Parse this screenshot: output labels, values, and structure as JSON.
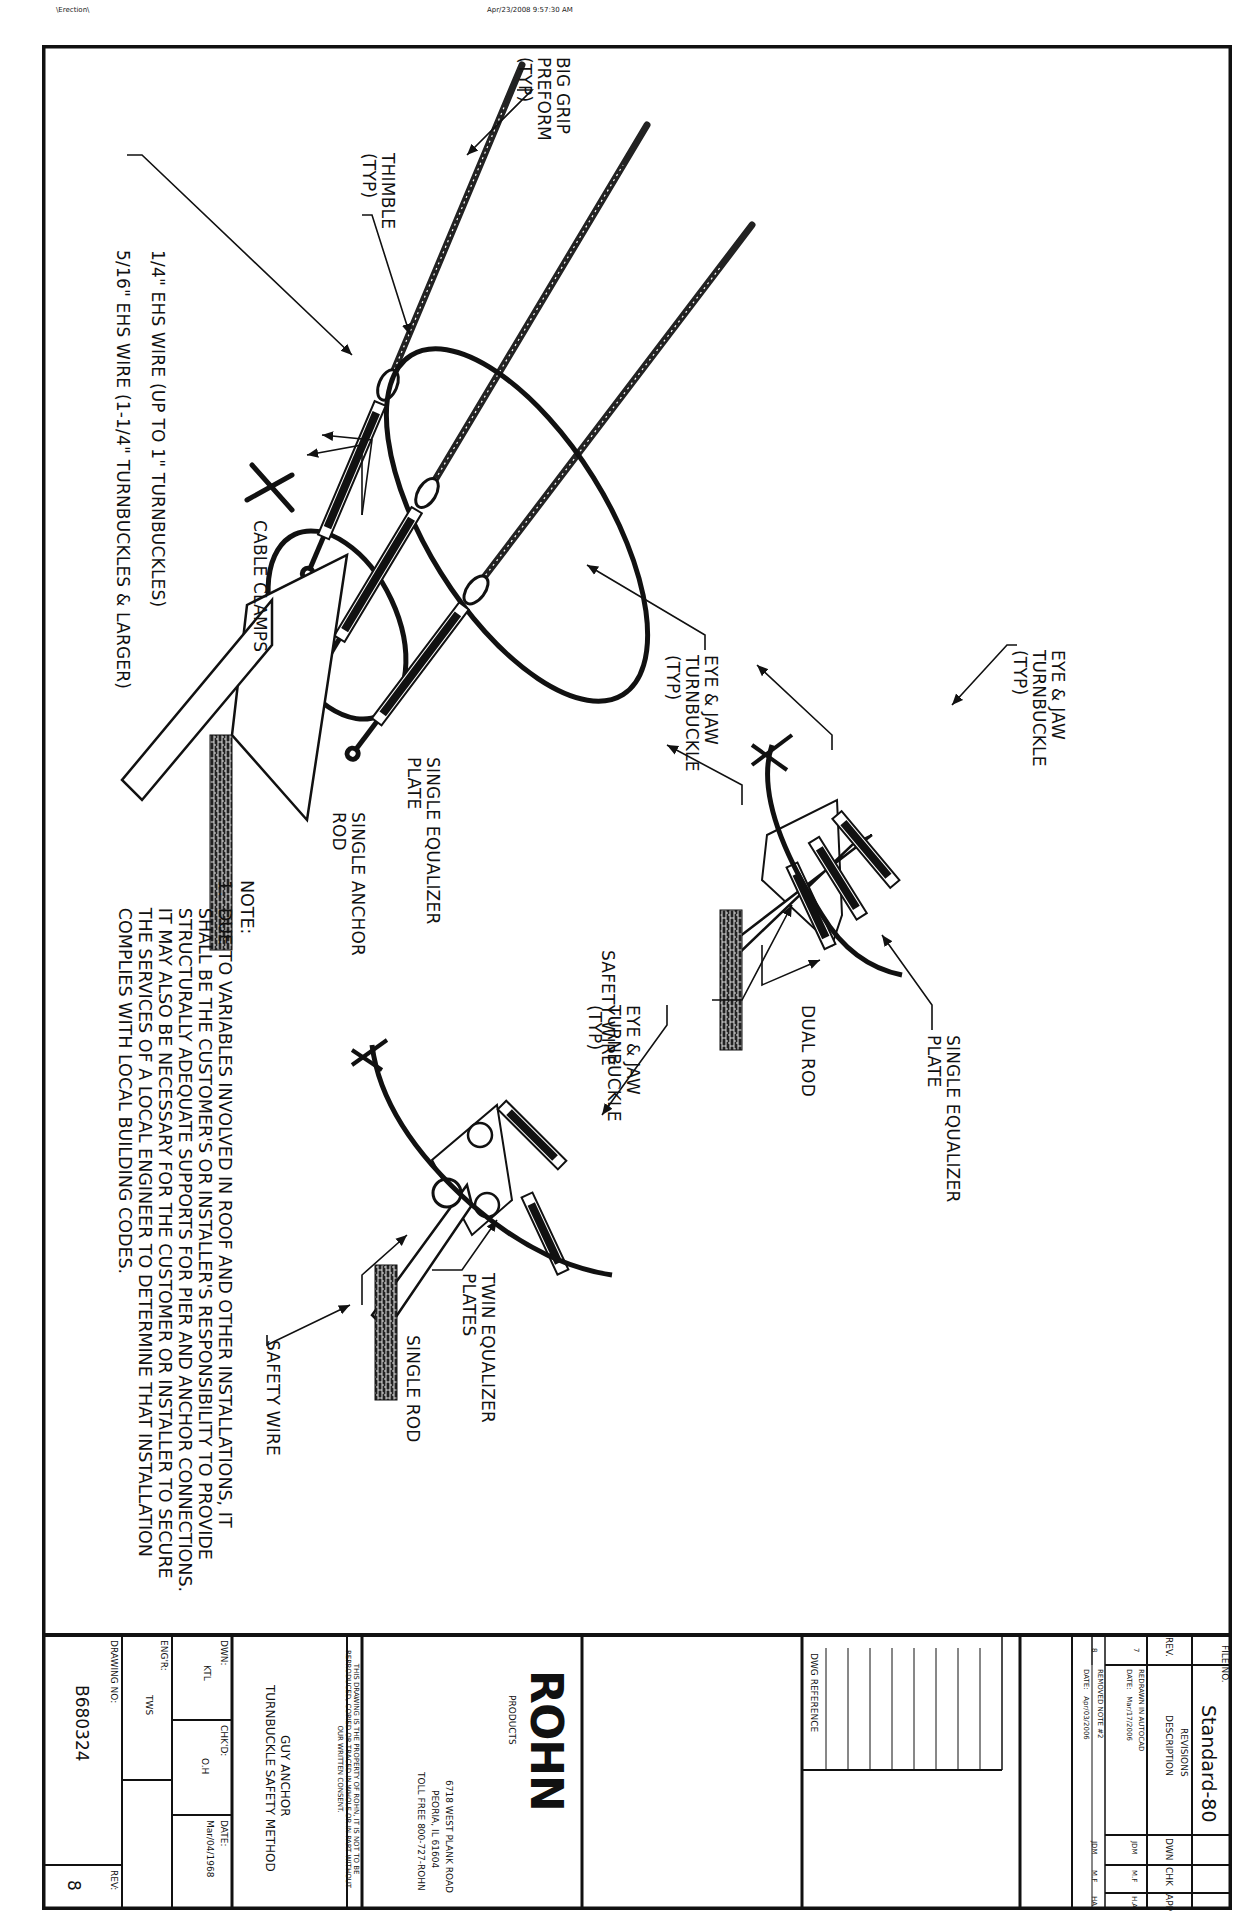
{
  "page_header": {
    "left_text": "\\Erection\\",
    "timestamp": "Apr/23/2008  9:57:30 AM"
  },
  "main_assembly": {
    "callouts": {
      "big_grip_preform": "BIG GRIP\nPREFORM\n(TYP)",
      "thimble": "THIMBLE\n(TYP)",
      "wire_quarter": "1/4\" EHS WIRE (UP TO 1\" TURNBUCKLES)",
      "wire_five_sixteenths": "5/16\" EHS WIRE (1-1/4\" TURNBUCKLES & LARGER)",
      "cable_clamps": "CABLE CLAMPS",
      "eye_jaw_turnbuckle": "EYE & JAW\nTURNBUCKLE\n(TYP)",
      "single_equalizer_plate": "SINGLE EQUALIZER\nPLATE",
      "single_anchor_rod": "SINGLE ANCHOR\nROD"
    }
  },
  "dual_rod_detail": {
    "callouts": {
      "eye_jaw_turnbuckle": "EYE & JAW\nTURNBUCKLE\n(TYP)",
      "single_equalizer_plate": "SINGLE EQUALIZER\nPLATE",
      "dual_rod": "DUAL ROD",
      "safety_wire": "SAFETY WIRE"
    }
  },
  "twin_plate_detail": {
    "callouts": {
      "eye_jaw_turnbuckle": "EYE & JAW\nTURNBUCKLE\n(TYP)",
      "twin_equalizer_plates": "TWIN EQUALIZER\nPLATES",
      "single_rod": "SINGLE ROD",
      "safety_wire": "SAFETY WIRE"
    }
  },
  "notes": {
    "heading": "NOTE:",
    "items": [
      "1.  DUE TO VARIABLES INVOLVED IN ROOF AND OTHER INSTALLATIONS, IT\n     SHALL BE THE CUSTOMER'S OR INSTALLER'S RESPONSIBILITY TO PROVIDE\n     STRUCTURALLY ADEQUATE SUPPORTS FOR PIER AND ANCHOR CONNECTIONS.\n     IT MAY ALSO BE NECESSARY FOR THE CUSTOMER OR INSTALLER TO SECURE\n     THE SERVICES OF A LOCAL ENGINEER TO DETERMINE THAT INSTALLATION\n     COMPLIES WITH LOCAL BUILDING CODES."
    ]
  },
  "title_block": {
    "file_no_label": "FILE NO.",
    "file_no": "Standard-80",
    "revisions": {
      "title": "REVISIONS",
      "headers": [
        "REV.",
        "DESCRIPTION",
        "DWN",
        "CHK",
        "APP"
      ],
      "rows": [
        {
          "rev": "7",
          "description": "REDRAWN IN AUTOCAD",
          "date": "DATE:   Mar/17/2006",
          "dwn": "JDM",
          "chk": "M.F",
          "app": "H.A"
        },
        {
          "rev": "8",
          "description": "REMOVED NOTE #2",
          "date": "DATE:   Apr/03/2006",
          "dwn": "JDM",
          "chk": "M.F",
          "app": "HA"
        }
      ]
    },
    "dwg_reference_label": "DWG REFERENCE",
    "company": {
      "logo": "ROHN",
      "logo_sub": "PRODUCTS",
      "address_line1": "6718 WEST PLANK ROAD",
      "address_line2": "PEORIA, IL 61604",
      "phone": "TOLL FREE 800-727-ROHN"
    },
    "disclaimer": "THIS DRAWING IS THE PROPERTY OF ROHN, IT IS NOT TO BE\nREPRODUCED, COPIED OR TRACED IN WHOLE OR IN PART WITHOUT\nOUR WRITTEN CONSENT.",
    "drawing_title_line1": "GUY ANCHOR",
    "drawing_title_line2": "TURNBUCKLE SAFETY METHOD",
    "dwn_label": "DWN:",
    "dwn_value": "KTL",
    "chkd_label": "CHK'D:",
    "chkd_value": "O.H",
    "date_label": "DATE:",
    "date_value": "Mar/04/1968",
    "engr_label": "ENG'R:",
    "engr_value": "TWS",
    "drawing_no_label": "DRAWING NO:",
    "drawing_no": "B680324",
    "rev_label": "REV:",
    "rev_value": "8"
  }
}
